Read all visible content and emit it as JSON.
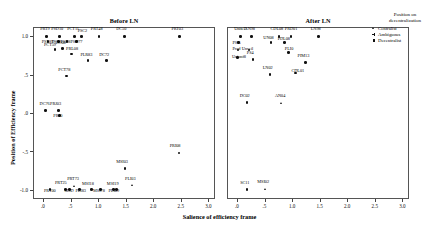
{
  "figure": {
    "x_axis_title": "Salience of efficiency frame",
    "y_axis_title": "Position of Efficiency frame"
  },
  "legend": {
    "title_line1": "Position on",
    "title_line2": "decentralization",
    "items": [
      {
        "label": "Centralist",
        "marker": "triangle"
      },
      {
        "label": "Ambiguous",
        "marker": "cross"
      },
      {
        "label": "Decentralist",
        "marker": "square"
      }
    ]
  },
  "chart_data": {
    "type": "scatter",
    "title": "",
    "xlabel": "Salience of efficiency frame",
    "ylabel": "Position of Efficiency frame",
    "ylim": [
      -1.12,
      1.12
    ],
    "yticks": [
      1.0,
      0.5,
      0.0,
      -0.5,
      -1.0
    ],
    "yticklabels": [
      "1.0",
      ".5",
      ".0",
      "-.5",
      "-1.0"
    ],
    "grid": false,
    "legend_position": "right",
    "panels": [
      {
        "name": "before",
        "title": "Before LN",
        "xlim": [
          -0.18,
          3.12
        ],
        "xticks": [
          0.0,
          0.5,
          1.0,
          1.5,
          2.0,
          2.5,
          3.0
        ],
        "xticklabels": [
          ".0",
          ".5",
          "1.0",
          "1.5",
          "2.0",
          "2.5",
          "3.0"
        ],
        "points": [
          {
            "label": "PRT9",
            "x": 0.06,
            "y": 1.0,
            "marker": "square",
            "lx": -0.02,
            "ly": 0.085
          },
          {
            "label": "PSD10",
            "x": 0.3,
            "y": 1.0,
            "marker": "square",
            "lx": -0.06,
            "ly": 0.085
          },
          {
            "label": "PCT11",
            "x": 0.57,
            "y": 1.0,
            "marker": "square",
            "lx": -0.04,
            "ly": 0.095
          },
          {
            "label": "PSC2",
            "x": 0.7,
            "y": 1.0,
            "marker": "square",
            "lx": 0.02,
            "ly": 0.06
          },
          {
            "label": "PRT48",
            "x": 1.02,
            "y": 1.0,
            "marker": "square",
            "lx": -0.06,
            "ly": 0.085
          },
          {
            "label": "DC50",
            "x": 1.48,
            "y": 1.0,
            "marker": "square",
            "lx": -0.06,
            "ly": 0.085
          },
          {
            "label": "PRT03",
            "x": 2.48,
            "y": 1.0,
            "marker": "square",
            "lx": -0.06,
            "ly": 0.085
          },
          {
            "label": "PSL89",
            "x": 0.09,
            "y": 0.93,
            "marker": "square",
            "lx": -0.02,
            "ly": -0.012
          },
          {
            "label": "DC05",
            "x": 0.28,
            "y": 0.93,
            "marker": "square",
            "lx": -0.03,
            "ly": -0.012
          },
          {
            "label": "PSD8",
            "x": 0.44,
            "y": 0.93,
            "marker": "square",
            "lx": -0.03,
            "ly": -0.012
          },
          {
            "label": "PSD77",
            "x": 0.61,
            "y": 0.93,
            "marker": "square",
            "lx": -0.02,
            "ly": -0.012
          },
          {
            "label": "PCT59",
            "x": 0.22,
            "y": 0.83,
            "marker": "square",
            "lx": -0.11,
            "ly": 0.055
          },
          {
            "label": "DC08",
            "x": 0.36,
            "y": 0.84,
            "marker": "square",
            "lx": -0.04,
            "ly": 0.07
          },
          {
            "label": "PRL08",
            "x": 0.52,
            "y": 0.77,
            "marker": "square",
            "lx": -0.01,
            "ly": 0.065
          },
          {
            "label": "PLR83",
            "x": 0.82,
            "y": 0.68,
            "marker": "square",
            "lx": -0.05,
            "ly": 0.075
          },
          {
            "label": "DC72",
            "x": 1.15,
            "y": 0.68,
            "marker": "square",
            "lx": -0.04,
            "ly": 0.075
          },
          {
            "label": "PCT78",
            "x": 0.43,
            "y": 0.48,
            "marker": "square",
            "lx": -0.06,
            "ly": 0.08
          },
          {
            "label": "DC76",
            "x": 0.05,
            "y": 0.03,
            "marker": "square",
            "lx": -0.02,
            "ly": 0.085
          },
          {
            "label": "PRJ03",
            "x": 0.28,
            "y": 0.03,
            "marker": "square",
            "lx": -0.06,
            "ly": 0.085
          },
          {
            "label": "PRJ0",
            "x": 0.3,
            "y": -0.03,
            "marker": "square",
            "lx": -0.02,
            "ly": -0.015
          },
          {
            "label": "PRT00",
            "x": 0.13,
            "y": -1.0,
            "marker": "square",
            "lx": -0.02,
            "ly": -0.015
          },
          {
            "label": "PRT25",
            "x": 0.41,
            "y": -1.0,
            "marker": "square",
            "lx": -0.1,
            "ly": 0.085
          },
          {
            "label": "PRT73",
            "x": 0.58,
            "y": -0.96,
            "marker": "triangle",
            "lx": -0.05,
            "ly": 0.095
          },
          {
            "label": "MSD",
            "x": 0.48,
            "y": -1.0,
            "marker": "square",
            "lx": 0.0,
            "ly": -0.015
          },
          {
            "label": "PLI83",
            "x": 0.66,
            "y": -1.0,
            "marker": "square",
            "lx": 0.02,
            "ly": -0.015
          },
          {
            "label": "MSI18",
            "x": 0.88,
            "y": -1.0,
            "marker": "square",
            "lx": -0.08,
            "ly": 0.075
          },
          {
            "label": "MSI19",
            "x": 1.33,
            "y": -1.0,
            "marker": "square",
            "lx": -0.08,
            "ly": 0.075
          },
          {
            "label": "MSI78",
            "x": 1.04,
            "y": -1.0,
            "marker": "square",
            "lx": -0.04,
            "ly": -0.015
          },
          {
            "label": "PLI09",
            "x": 1.28,
            "y": -1.0,
            "marker": "square",
            "lx": 0.0,
            "ly": -0.015
          },
          {
            "label": "MSI03",
            "x": 1.49,
            "y": -0.72,
            "marker": "square",
            "lx": -0.07,
            "ly": 0.08
          },
          {
            "label": "PLI03",
            "x": 1.62,
            "y": -0.95,
            "marker": "triangle",
            "lx": -0.04,
            "ly": 0.085
          },
          {
            "label": "PRI08",
            "x": 2.47,
            "y": -0.52,
            "marker": "square",
            "lx": -0.08,
            "ly": 0.085
          }
        ]
      },
      {
        "name": "after",
        "title": "After LN",
        "xlim": [
          -0.18,
          3.12
        ],
        "xticks": [
          0.0,
          0.5,
          1.0,
          1.5,
          2.0,
          2.5,
          3.0
        ],
        "xticklabels": [
          ".0",
          ".5",
          "1.0",
          "1.5",
          "2.0",
          "2.5",
          "3.0"
        ],
        "points": [
          {
            "label": "UniteD",
            "x": 0.06,
            "y": 1.0,
            "marker": "square",
            "lx": -0.02,
            "ly": 0.085
          },
          {
            "label": "AN98",
            "x": 0.26,
            "y": 1.0,
            "marker": "square",
            "lx": -0.03,
            "ly": 0.085
          },
          {
            "label": "CDL08",
            "x": 0.76,
            "y": 1.0,
            "marker": "square",
            "lx": -0.06,
            "ly": 0.085
          },
          {
            "label": "PRD01",
            "x": 0.98,
            "y": 1.0,
            "marker": "square",
            "lx": -0.02,
            "ly": 0.085
          },
          {
            "label": "LN98",
            "x": 1.48,
            "y": 1.0,
            "marker": "square",
            "lx": -0.05,
            "ly": 0.085
          },
          {
            "label": "PSI5",
            "x": 0.03,
            "y": 0.92,
            "marker": "square",
            "lx": -0.02,
            "ly": -0.012
          },
          {
            "label": "UN08",
            "x": 0.62,
            "y": 0.92,
            "marker": "square",
            "lx": -0.05,
            "ly": 0.05
          },
          {
            "label": "PDL08",
            "x": 0.86,
            "y": 0.92,
            "marker": "square",
            "lx": -0.03,
            "ly": 0.04
          },
          {
            "label": "Prod",
            "x": 0.02,
            "y": 0.82,
            "marker": "square",
            "lx": -0.01,
            "ly": 0.008
          },
          {
            "label": "Unveil",
            "x": 0.22,
            "y": 0.82,
            "marker": "square",
            "lx": -0.04,
            "ly": 0.008
          },
          {
            "label": "PLI0",
            "x": 0.94,
            "y": 0.79,
            "marker": "square",
            "lx": 0.02,
            "ly": 0.035
          },
          {
            "label": "Unionf8",
            "x": 0.01,
            "y": 0.72,
            "marker": "square",
            "lx": -0.01,
            "ly": 0.012
          },
          {
            "label": "PS4",
            "x": 0.29,
            "y": 0.7,
            "marker": "square",
            "lx": -0.02,
            "ly": 0.075
          },
          {
            "label": "PIM13",
            "x": 1.24,
            "y": 0.66,
            "marker": "square",
            "lx": -0.05,
            "ly": 0.075
          },
          {
            "label": "LN02",
            "x": 0.6,
            "y": 0.5,
            "marker": "square",
            "lx": -0.04,
            "ly": 0.085
          },
          {
            "label": "CDL01",
            "x": 1.06,
            "y": 0.52,
            "marker": "square",
            "lx": 0.02,
            "ly": 0.02
          },
          {
            "label": "DC02",
            "x": 0.18,
            "y": 0.14,
            "marker": "square",
            "lx": -0.04,
            "ly": 0.085
          },
          {
            "label": "AN04",
            "x": 0.82,
            "y": 0.12,
            "marker": "triangle",
            "lx": -0.04,
            "ly": 0.105
          },
          {
            "label": "SC11",
            "x": 0.18,
            "y": -1.0,
            "marker": "square",
            "lx": -0.03,
            "ly": 0.085
          },
          {
            "label": "MSI02",
            "x": 0.52,
            "y": -1.0,
            "marker": "triangle",
            "lx": -0.06,
            "ly": 0.095
          }
        ]
      }
    ]
  }
}
